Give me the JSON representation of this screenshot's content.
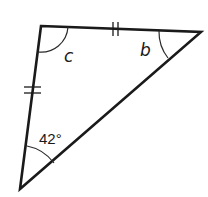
{
  "diagram": {
    "type": "triangle",
    "vertices": {
      "top_left": {
        "x": 41,
        "y": 26
      },
      "top_right": {
        "x": 201,
        "y": 32
      },
      "bottom": {
        "x": 20,
        "y": 189
      }
    },
    "angles": {
      "top_left": {
        "label": "c"
      },
      "top_right": {
        "label": "b"
      },
      "bottom": {
        "label": "42°"
      }
    },
    "congruent_sides": {
      "marks": 2,
      "sides": [
        "top",
        "left"
      ]
    },
    "stroke_color": "#1a1a1a",
    "background": "#ffffff"
  }
}
